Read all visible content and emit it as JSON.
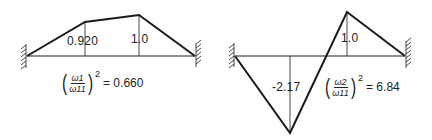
{
  "diagram": {
    "title": "",
    "line_color": "#1a1a1a",
    "modes": [
      {
        "name": "mode-1",
        "node_labels": [
          "0.920",
          "1.0"
        ],
        "formula": {
          "numerator": "ω1",
          "denominator": "ω11",
          "exponent": "2",
          "equals": "= 0.660"
        }
      },
      {
        "name": "mode-2",
        "node_labels": [
          "-2.17",
          "1.0"
        ],
        "formula": {
          "numerator": "ω2",
          "denominator": "ω11",
          "exponent": "2",
          "equals": "= 6.84"
        }
      }
    ]
  }
}
